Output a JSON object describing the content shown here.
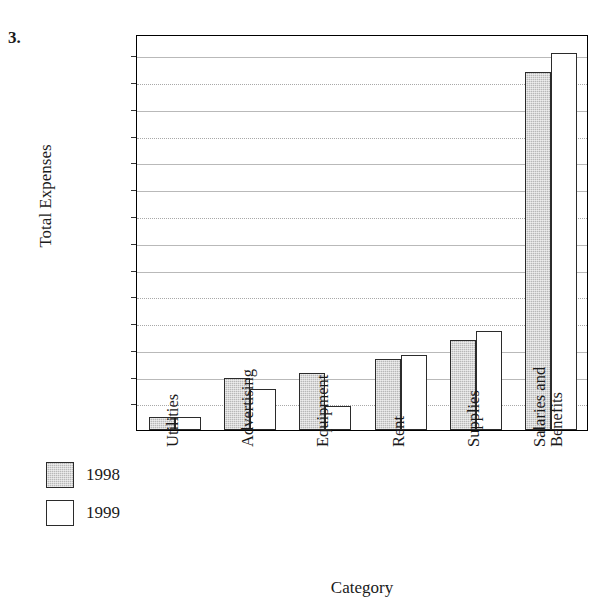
{
  "problem_number": "3.",
  "chart_data": {
    "type": "bar",
    "title": "",
    "xlabel": "Category",
    "ylabel": "Total Expenses",
    "categories": [
      "Utilities",
      "Advertising",
      "Equipment",
      "Rent",
      "Supplies",
      "Salaries and Benefits"
    ],
    "category_lines": [
      [
        "Utilities"
      ],
      [
        "Advertising"
      ],
      [
        "Equipment"
      ],
      [
        "Rent"
      ],
      [
        "Supplies"
      ],
      [
        "Salaries and",
        "Benefits"
      ]
    ],
    "series": [
      {
        "name": "1998",
        "color": "#b8b8b8",
        "values": [
          500,
          1950,
          2150,
          2650,
          3350,
          13400
        ]
      },
      {
        "name": "1999",
        "color": "#ffffff",
        "values": [
          500,
          1550,
          900,
          2800,
          3700,
          14100
        ]
      }
    ],
    "ylim": [
      0,
      14800
    ],
    "ytick_values": [
      1000,
      2000,
      3000,
      4000,
      5000,
      6000,
      7000,
      8000,
      9000,
      10000,
      11000,
      12000,
      13000,
      14000
    ],
    "ytick_labels": [
      "1000",
      "2000",
      "3000",
      "4000",
      "5000",
      "6000",
      "7000",
      "8000",
      "9000",
      "10,000",
      "11,000",
      "12,000",
      "13,000",
      "14,000"
    ],
    "grid": true,
    "legend_position": "left-below"
  },
  "legend": {
    "entries": [
      {
        "label": "1998",
        "swatch": "gray-filled"
      },
      {
        "label": "1999",
        "swatch": "white-filled"
      }
    ]
  }
}
